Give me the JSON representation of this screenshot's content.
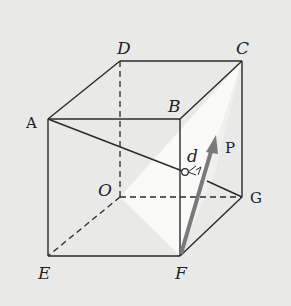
{
  "diagram": {
    "type": "cube-with-plane-and-vector",
    "labels": {
      "A": "A",
      "B": "B",
      "C": "C",
      "D": "D",
      "E": "E",
      "F": "F",
      "G": "G",
      "O": "O",
      "P": "P",
      "d": "d"
    },
    "colors": {
      "background": "#e9e9e7",
      "edge": "#2a2a2a",
      "plane": "#fbfbfa",
      "arrow": "#7a7a7a"
    }
  }
}
